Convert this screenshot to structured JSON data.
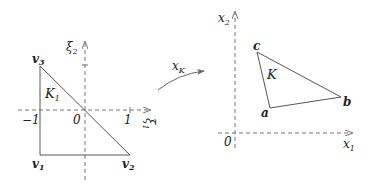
{
  "reference_element": {
    "name": "K_1",
    "vertices": [
      {
        "label": "v",
        "sub": "1",
        "coords": [
          -1,
          -1
        ]
      },
      {
        "label": "v",
        "sub": "2",
        "coords": [
          1,
          -1
        ]
      },
      {
        "label": "v",
        "sub": "3",
        "coords": [
          -1,
          1
        ]
      }
    ],
    "axis_x_label": "ξ",
    "axis_x_sub": "1",
    "axis_y_label": "ξ",
    "axis_y_sub": "2",
    "ticks": {
      "neg_one": "−1",
      "zero": "0",
      "one": "1"
    },
    "element_label": "K",
    "element_sub": "1"
  },
  "mapping": {
    "label": "x",
    "sub": "K"
  },
  "physical_element": {
    "name": "K",
    "vertices": [
      {
        "label": "a"
      },
      {
        "label": "b"
      },
      {
        "label": "c"
      }
    ],
    "axis_x_label": "x",
    "axis_x_sub": "1",
    "axis_y_label": "x",
    "axis_y_sub": "2",
    "origin_label": "0",
    "element_label": "K"
  },
  "colors": {
    "line": "#555555",
    "axis": "#777777",
    "text": "#222222"
  }
}
